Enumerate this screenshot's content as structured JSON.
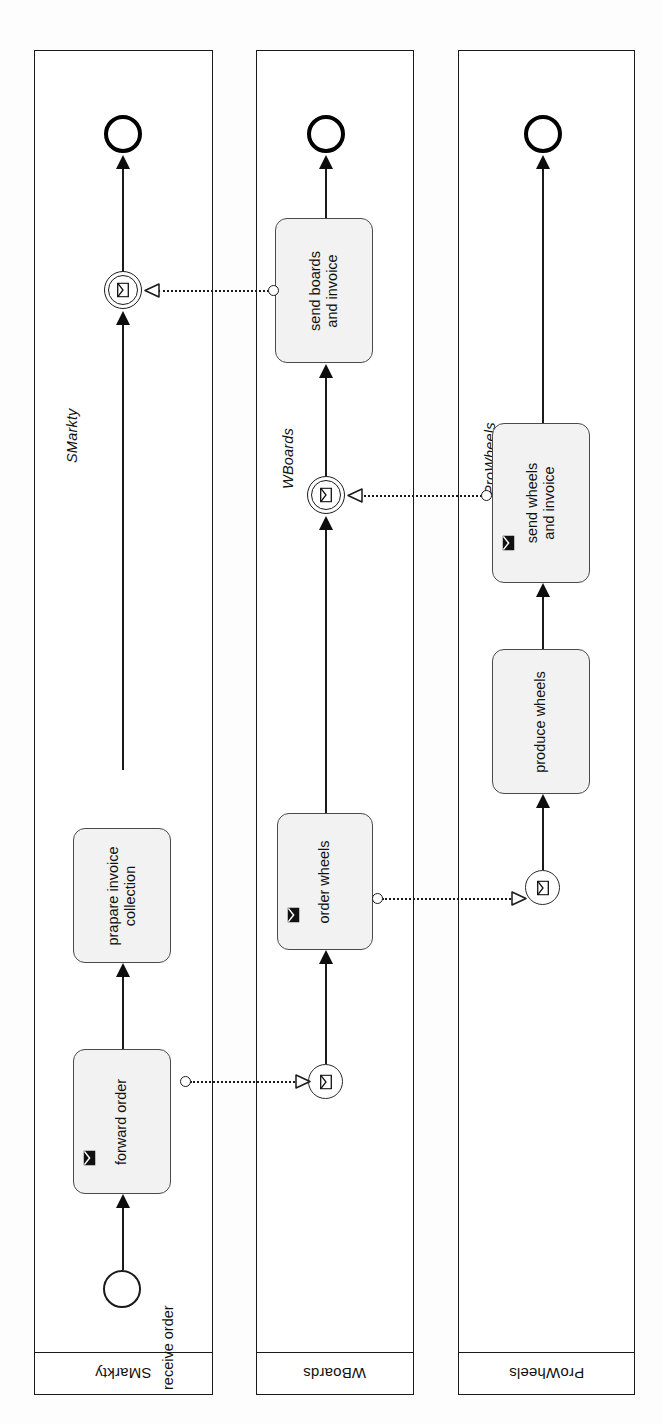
{
  "diagram": {
    "type": "bpmn-collaboration",
    "notation": "BPMN 2.0",
    "orientation": "rotated-90-counterclockwise"
  },
  "pools": [
    {
      "id": "smarkty",
      "header_label": "SMarkty",
      "name_label": "SMarkty",
      "elements": [
        {
          "id": "receive-order",
          "kind": "start-event",
          "event_type": "none",
          "label": "receive order"
        },
        {
          "id": "forward-order",
          "kind": "task",
          "task_type": "send",
          "label": "forward order",
          "marker": "send-envelope-icon"
        },
        {
          "id": "prapare-invoice-collection",
          "kind": "task",
          "task_type": "none",
          "label_line1": "prapare invoice",
          "label_line2": "collection"
        },
        {
          "id": "smarkty-receive-boards",
          "kind": "intermediate-event",
          "event_type": "message-catch",
          "label": ""
        },
        {
          "id": "smarkty-end",
          "kind": "end-event",
          "event_type": "none",
          "label": ""
        }
      ]
    },
    {
      "id": "wboards",
      "header_label": "WBoards",
      "name_label": "WBoards",
      "elements": [
        {
          "id": "wboards-start",
          "kind": "start-event",
          "event_type": "message",
          "label": ""
        },
        {
          "id": "order-wheels",
          "kind": "task",
          "task_type": "send",
          "label": "order wheels",
          "marker": "send-envelope-icon"
        },
        {
          "id": "wboards-receive-wheels",
          "kind": "intermediate-event",
          "event_type": "message-catch",
          "label": ""
        },
        {
          "id": "send-boards-and-invoice",
          "kind": "task",
          "task_type": "none",
          "label_line1": "send boards",
          "label_line2": "and invoice"
        },
        {
          "id": "wboards-end",
          "kind": "end-event",
          "event_type": "none",
          "label": ""
        }
      ]
    },
    {
      "id": "prowheels",
      "header_label": "ProWheels",
      "name_label": "ProWheels",
      "elements": [
        {
          "id": "prowheels-start",
          "kind": "start-event",
          "event_type": "message",
          "label": ""
        },
        {
          "id": "produce-wheels",
          "kind": "task",
          "task_type": "none",
          "label": "produce wheels"
        },
        {
          "id": "send-wheels-and-invoice",
          "kind": "task",
          "task_type": "send",
          "label_line1": "send wheels",
          "label_line2": "and invoice",
          "marker": "send-envelope-icon"
        },
        {
          "id": "prowheels-end",
          "kind": "end-event",
          "event_type": "none",
          "label": ""
        }
      ]
    }
  ],
  "message_flows": [
    {
      "id": "mf-forward-order",
      "from": "forward-order",
      "to": "wboards-start"
    },
    {
      "id": "mf-order-wheels",
      "from": "order-wheels",
      "to": "prowheels-start"
    },
    {
      "id": "mf-send-wheels",
      "from": "send-wheels-and-invoice",
      "to": "wboards-receive-wheels"
    },
    {
      "id": "mf-send-boards",
      "from": "send-boards-and-invoice",
      "to": "smarkty-receive-boards"
    }
  ],
  "colors": {
    "stroke": "#1a1a1a",
    "task_fill": "#f2f2f2",
    "task_stroke": "#4a4a4a",
    "page": "#ffffff"
  }
}
